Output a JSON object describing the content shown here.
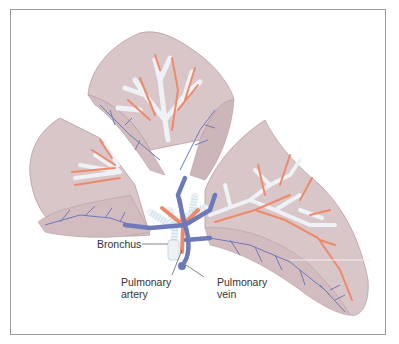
{
  "figure": {
    "colors": {
      "lobe_fill": "#d9c6c8",
      "lobe_edge": "#b59ea2",
      "bronchus": "#eef2f7",
      "artery": "#ee8a6a",
      "vein": "#6d79b8",
      "leader_line": "#666666",
      "frame_border": "#9a9a9a"
    }
  },
  "labels": {
    "bronchus": "Bronchus",
    "pulmonary_artery_line1": "Pulmonary",
    "pulmonary_artery_line2": "artery",
    "pulmonary_vein_line1": "Pulmonary",
    "pulmonary_vein_line2": "vein"
  }
}
